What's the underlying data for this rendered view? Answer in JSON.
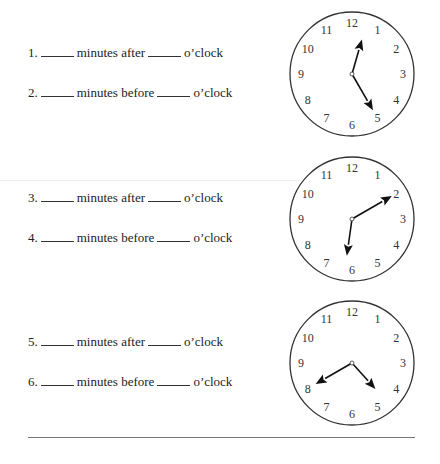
{
  "questions": [
    {
      "number": "1.",
      "middle": "minutes after",
      "end": "o’clock"
    },
    {
      "number": "2.",
      "middle": "minutes before",
      "end": "o’clock"
    },
    {
      "number": "3.",
      "middle": "minutes after",
      "end": "o’clock"
    },
    {
      "number": "4.",
      "middle": "minutes before",
      "end": "o’clock"
    },
    {
      "number": "5.",
      "middle": "minutes after",
      "end": "o’clock"
    },
    {
      "number": "6.",
      "middle": "minutes before",
      "end": "o’clock"
    }
  ],
  "clock_numerals": [
    "12",
    "1",
    "2",
    "3",
    "4",
    "5",
    "6",
    "7",
    "8",
    "9",
    "10",
    "11"
  ],
  "clocks": [
    {
      "id": "clock-1",
      "hour_hand_deg": 16,
      "minute_hand_deg": 150,
      "approx_time": "12:25"
    },
    {
      "id": "clock-2",
      "hour_hand_deg": 188,
      "minute_hand_deg": 60,
      "approx_time": "6:10"
    },
    {
      "id": "clock-3",
      "hour_hand_deg": 138,
      "minute_hand_deg": 240,
      "approx_time": "4:40"
    }
  ],
  "colors": {
    "ink": "#222222",
    "rule": "#777777"
  }
}
